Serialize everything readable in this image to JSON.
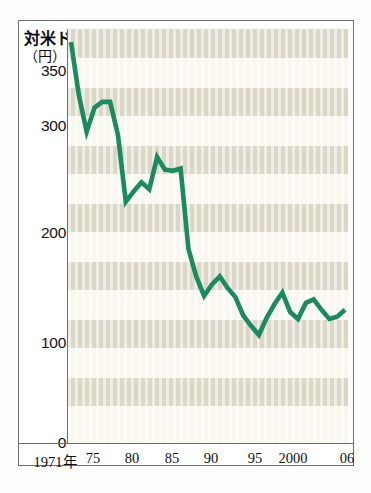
{
  "figure": {
    "title": "対米ドル",
    "unit_label": "（円）",
    "line_color": "#1a8a5f",
    "band_color_dark": "#d9d5c4",
    "band_color_light": "#faf8ee",
    "frame_color": "#6f6f6f"
  },
  "chart_data": {
    "type": "line",
    "title": "対米ドル",
    "xlabel": "",
    "ylabel": "（円）",
    "ylim": [
      0,
      360
    ],
    "xlim": [
      1971,
      2006
    ],
    "grid": "horizontal-bands",
    "legend": "none",
    "ytick_labels": [
      "350",
      "300",
      "200",
      "100",
      "0"
    ],
    "ytick_values": [
      350,
      300,
      200,
      100,
      0
    ],
    "xtick_labels": [
      "1971年",
      "75",
      "80",
      "85",
      "90",
      "95",
      "2000",
      "06"
    ],
    "xtick_values": [
      1971,
      1975,
      1980,
      1985,
      1990,
      1995,
      2000,
      2006
    ],
    "series": [
      {
        "name": "対米ドル円相場",
        "x": [
          1971,
          1972,
          1973,
          1974,
          1975,
          1976,
          1977,
          1978,
          1979,
          1980,
          1981,
          1982,
          1983,
          1984,
          1985,
          1986,
          1987,
          1988,
          1989,
          1990,
          1991,
          1992,
          1993,
          1994,
          1995,
          1996,
          1997,
          1998,
          1999,
          2000,
          2001,
          2002,
          2003,
          2004,
          2005,
          2006
        ],
        "values": [
          349,
          303,
          271,
          292,
          297,
          297,
          268,
          210,
          219,
          227,
          221,
          249,
          238,
          237,
          239,
          169,
          145,
          128,
          138,
          145,
          135,
          127,
          111,
          102,
          94,
          109,
          121,
          131,
          114,
          108,
          122,
          125,
          116,
          108,
          110,
          116
        ]
      }
    ]
  }
}
